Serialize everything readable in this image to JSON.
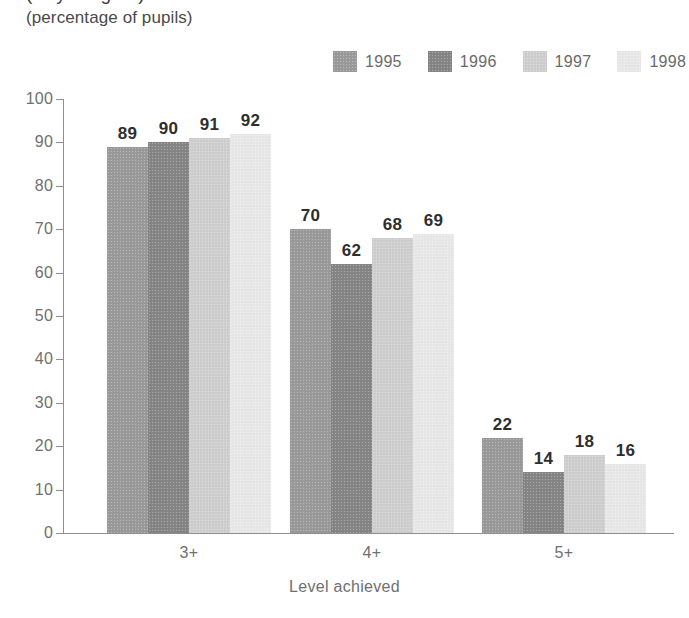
{
  "chart_data": {
    "type": "bar",
    "title": "(Key Stage 2)",
    "title_clipped": true,
    "subtitle": "(percentage of pupils)",
    "xlabel": "Level achieved",
    "ylabel": "",
    "ylim": [
      0,
      100
    ],
    "ytick_step": 10,
    "yticks": [
      "100",
      "90",
      "80",
      "70",
      "60",
      "50",
      "40",
      "30",
      "20",
      "10",
      "0"
    ],
    "grid": false,
    "legend_position": "top-right",
    "categories": [
      "3+",
      "4+",
      "5+"
    ],
    "series": [
      {
        "name": "1995",
        "color": "#9a9a9a",
        "values": [
          89,
          70,
          22
        ]
      },
      {
        "name": "1996",
        "color": "#858585",
        "values": [
          90,
          62,
          14
        ]
      },
      {
        "name": "1997",
        "color": "#cfcfcf",
        "values": [
          91,
          68,
          18
        ]
      },
      {
        "name": "1998",
        "color": "#e8e8e8",
        "values": [
          92,
          69,
          16
        ]
      }
    ],
    "value_labels": {
      "3+": [
        "89",
        "90",
        "91",
        "92"
      ],
      "4+": [
        "70",
        "62",
        "68",
        "69"
      ],
      "5+": [
        "22",
        "14",
        "18",
        "16"
      ]
    },
    "axis_color": "#8e8e8e",
    "label_color": "#6f6f6f",
    "value_label_color": "#2e2e2e"
  }
}
